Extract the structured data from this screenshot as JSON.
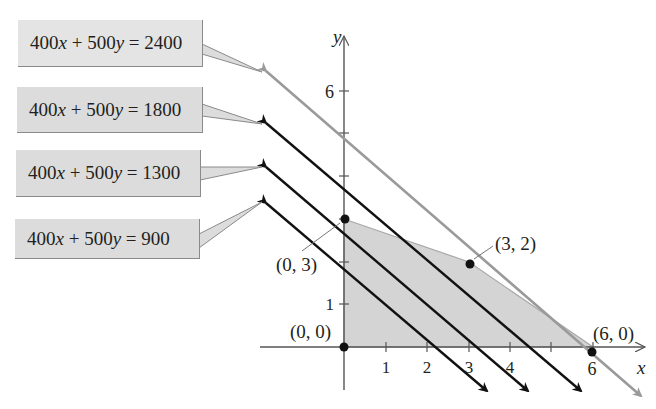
{
  "chart_data": {
    "type": "line",
    "title": "",
    "xlabel": "x",
    "ylabel": "y",
    "xlim": [
      -1.9,
      7.3
    ],
    "ylim": [
      -1.0,
      6.5
    ],
    "x_ticks": [
      1,
      2,
      3,
      4,
      5,
      6
    ],
    "x_tick_labels": [
      "1",
      "2",
      "3",
      "4",
      "",
      "6"
    ],
    "y_ticks": [
      1,
      2,
      3,
      4,
      5,
      6
    ],
    "y_tick_labels": [
      "1",
      "",
      "",
      "",
      "",
      "6"
    ],
    "grid": false,
    "feasible_region": {
      "vertices": [
        [
          0,
          0
        ],
        [
          0,
          3
        ],
        [
          3,
          2
        ],
        [
          6,
          0
        ]
      ],
      "fill": "#d4d4d4"
    },
    "points": [
      {
        "x": 0,
        "y": 0,
        "label": "(0, 0)"
      },
      {
        "x": 0,
        "y": 3,
        "label": "(0, 3)"
      },
      {
        "x": 3,
        "y": 2,
        "label": "(3, 2)"
      },
      {
        "x": 6,
        "y": 0,
        "label": "(6, 0)"
      }
    ],
    "series": [
      {
        "name": "400x + 500y = 2400",
        "a": 400,
        "b": 500,
        "c": 2400,
        "color": "#9a9a9a"
      },
      {
        "name": "400x + 500y = 1800",
        "a": 400,
        "b": 500,
        "c": 1800,
        "color": "#111111"
      },
      {
        "name": "400x + 500y = 1300",
        "a": 400,
        "b": 500,
        "c": 1300,
        "color": "#111111"
      },
      {
        "name": "400x + 500y = 900",
        "a": 400,
        "b": 500,
        "c": 900,
        "color": "#111111"
      }
    ]
  },
  "labels": {
    "eq_2400": "400x + 500y = 2400",
    "eq_1800": "400x + 500y = 1800",
    "eq_1300": "400x + 500y = 1300",
    "eq_900": "400x + 500y = 900",
    "pt_00": "(0, 0)",
    "pt_03": "(0, 3)",
    "pt_32": "(3, 2)",
    "pt_60": "(6, 0)",
    "axis_x": "x",
    "axis_y": "y",
    "tick_x1": "1",
    "tick_x2": "2",
    "tick_x3": "3",
    "tick_x4": "4",
    "tick_x6": "6",
    "tick_y1": "1",
    "tick_y6": "6"
  },
  "colors": {
    "region": "#d4d4d4",
    "axis": "#555555",
    "objective_lines": "#111111",
    "optimal_line": "#9a9a9a",
    "label_box": "#dcdcdc"
  }
}
